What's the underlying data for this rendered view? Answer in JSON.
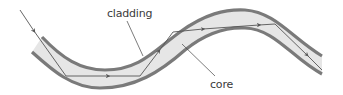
{
  "diagram": {
    "labels": {
      "cladding": "cladding",
      "core": "core"
    },
    "colors": {
      "background": "#ffffff",
      "core_fill": "#e6e6e6",
      "cladding_stroke": "#7a7a7a",
      "ray_stroke": "#555555",
      "leader_stroke": "#444444",
      "label_text": "#3a3a3a"
    }
  }
}
